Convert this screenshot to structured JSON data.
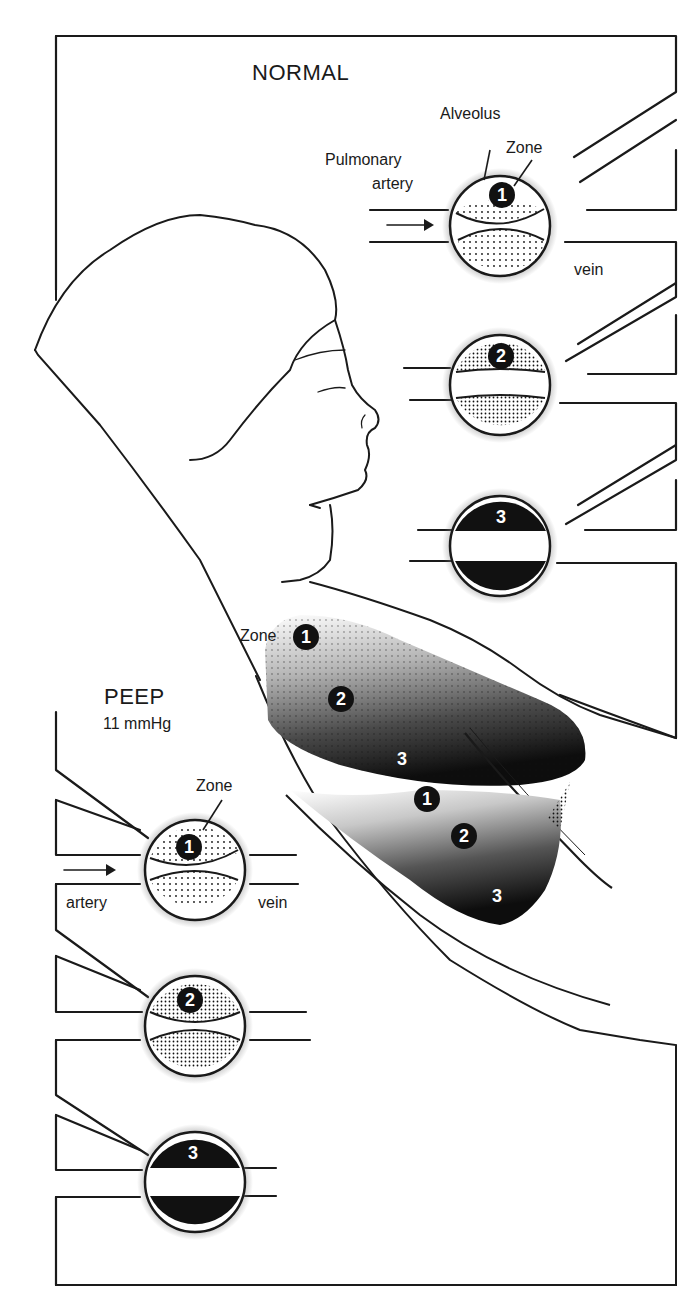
{
  "figure": {
    "normal_section": {
      "title": "NORMAL",
      "labels": {
        "alveolus": "Alveolus",
        "zone": "Zone",
        "pulmonary_artery_line1": "Pulmonary",
        "pulmonary_artery_line2": "artery",
        "vein": "vein"
      },
      "alveoli": [
        {
          "zone": "1",
          "state": "capillary partially compressed by alveolus"
        },
        {
          "zone": "2",
          "state": "capillary open, shaded above and below"
        },
        {
          "zone": "3",
          "state": "capillary fully open, dark fill"
        }
      ]
    },
    "peep_section": {
      "title": "PEEP",
      "pressure": "11 mmHg",
      "labels": {
        "zone": "Zone",
        "artery": "artery",
        "vein": "vein"
      },
      "alveoli": [
        {
          "zone": "1",
          "state": "capillary compressed"
        },
        {
          "zone": "2",
          "state": "capillary compressed"
        },
        {
          "zone": "3",
          "state": "capillary open"
        }
      ]
    },
    "lung_labels": {
      "zone_prefix": "Zone",
      "upper_lung_zones": [
        "1",
        "2",
        "3"
      ],
      "lower_lung_zones": [
        "1",
        "2",
        "3"
      ]
    },
    "colors": {
      "ink": "#1a1a1a",
      "background": "#ffffff"
    }
  }
}
